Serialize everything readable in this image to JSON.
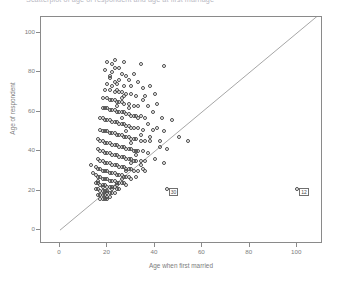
{
  "chart_title": "Scatterplot of age of respondent and age at first marriage",
  "axes": {
    "y_title": "Age of respondent",
    "x_title": "Age when first married",
    "y_ticks": [
      0,
      20,
      40,
      60,
      80,
      100
    ],
    "x_ticks": [
      0,
      20,
      40,
      60,
      80,
      100
    ],
    "y_min": -6,
    "y_max": 108,
    "x_min": -8,
    "x_max": 110
  },
  "reference_line": {
    "label": "identity-line",
    "from": [
      0,
      0
    ],
    "to": [
      110,
      110
    ]
  },
  "annotations": [
    {
      "label": "30",
      "x": 45,
      "y": 21
    },
    {
      "label": "12",
      "x": 100,
      "y": 21
    }
  ],
  "colors": {
    "frame": "#8a8a8a",
    "marker": "#4a4a4a",
    "line": "#8f8f8f",
    "text": "#7c7c7c",
    "title": "#b9b9c4"
  },
  "chart_data": {
    "type": "scatter",
    "title": "Scatterplot of age of respondent and age at first marriage",
    "xlabel": "Age when first married",
    "ylabel": "Age of respondent",
    "xlim": [
      -8,
      110
    ],
    "ylim": [
      -6,
      108
    ],
    "grid": false,
    "legend": "none",
    "marker_style": "open-circle",
    "series": [
      {
        "name": "respondents",
        "points": [
          [
            23,
            86
          ],
          [
            22,
            84
          ],
          [
            27,
            85
          ],
          [
            23,
            82
          ],
          [
            34,
            84
          ],
          [
            44,
            83
          ],
          [
            22,
            80
          ],
          [
            26,
            79
          ],
          [
            28,
            78
          ],
          [
            31,
            79
          ],
          [
            21,
            77
          ],
          [
            25,
            76
          ],
          [
            29,
            76
          ],
          [
            33,
            75
          ],
          [
            20,
            74
          ],
          [
            24,
            74
          ],
          [
            27,
            73
          ],
          [
            30,
            73
          ],
          [
            35,
            72
          ],
          [
            38,
            73
          ],
          [
            19,
            71
          ],
          [
            21,
            71
          ],
          [
            23,
            70
          ],
          [
            25,
            70
          ],
          [
            26,
            70
          ],
          [
            28,
            69
          ],
          [
            30,
            69
          ],
          [
            32,
            68
          ],
          [
            36,
            68
          ],
          [
            40,
            69
          ],
          [
            18,
            67
          ],
          [
            20,
            67
          ],
          [
            21,
            66
          ],
          [
            22,
            66
          ],
          [
            23,
            66
          ],
          [
            24,
            65
          ],
          [
            25,
            65
          ],
          [
            26,
            65
          ],
          [
            27,
            64
          ],
          [
            29,
            64
          ],
          [
            31,
            63
          ],
          [
            33,
            63
          ],
          [
            37,
            63
          ],
          [
            41,
            64
          ],
          [
            18,
            62
          ],
          [
            19,
            62
          ],
          [
            20,
            62
          ],
          [
            21,
            61
          ],
          [
            22,
            61
          ],
          [
            23,
            61
          ],
          [
            24,
            60
          ],
          [
            25,
            60
          ],
          [
            26,
            60
          ],
          [
            27,
            60
          ],
          [
            28,
            59
          ],
          [
            29,
            59
          ],
          [
            30,
            58
          ],
          [
            32,
            58
          ],
          [
            34,
            58
          ],
          [
            36,
            57
          ],
          [
            17,
            57
          ],
          [
            18,
            57
          ],
          [
            19,
            56
          ],
          [
            20,
            56
          ],
          [
            21,
            56
          ],
          [
            22,
            55
          ],
          [
            23,
            55
          ],
          [
            24,
            55
          ],
          [
            25,
            54
          ],
          [
            26,
            54
          ],
          [
            27,
            54
          ],
          [
            28,
            53
          ],
          [
            29,
            53
          ],
          [
            30,
            52
          ],
          [
            31,
            52
          ],
          [
            33,
            52
          ],
          [
            35,
            51
          ],
          [
            39,
            51
          ],
          [
            44,
            50
          ],
          [
            17,
            51
          ],
          [
            18,
            50
          ],
          [
            19,
            50
          ],
          [
            20,
            50
          ],
          [
            21,
            49
          ],
          [
            22,
            49
          ],
          [
            23,
            49
          ],
          [
            24,
            48
          ],
          [
            25,
            48
          ],
          [
            26,
            48
          ],
          [
            27,
            47
          ],
          [
            28,
            47
          ],
          [
            29,
            47
          ],
          [
            30,
            46
          ],
          [
            31,
            46
          ],
          [
            32,
            46
          ],
          [
            34,
            45
          ],
          [
            36,
            45
          ],
          [
            38,
            45
          ],
          [
            42,
            45
          ],
          [
            16,
            46
          ],
          [
            17,
            45
          ],
          [
            18,
            45
          ],
          [
            19,
            44
          ],
          [
            20,
            44
          ],
          [
            21,
            44
          ],
          [
            22,
            43
          ],
          [
            23,
            43
          ],
          [
            24,
            43
          ],
          [
            25,
            42
          ],
          [
            26,
            42
          ],
          [
            27,
            42
          ],
          [
            28,
            41
          ],
          [
            29,
            41
          ],
          [
            30,
            41
          ],
          [
            31,
            40
          ],
          [
            32,
            40
          ],
          [
            33,
            40
          ],
          [
            35,
            40
          ],
          [
            37,
            39
          ],
          [
            16,
            41
          ],
          [
            17,
            40
          ],
          [
            18,
            40
          ],
          [
            19,
            39
          ],
          [
            20,
            39
          ],
          [
            21,
            39
          ],
          [
            22,
            38
          ],
          [
            23,
            38
          ],
          [
            24,
            38
          ],
          [
            25,
            37
          ],
          [
            26,
            37
          ],
          [
            27,
            37
          ],
          [
            28,
            36
          ],
          [
            29,
            36
          ],
          [
            30,
            36
          ],
          [
            31,
            35
          ],
          [
            32,
            35
          ],
          [
            34,
            35
          ],
          [
            36,
            35
          ],
          [
            16,
            36
          ],
          [
            17,
            35
          ],
          [
            18,
            35
          ],
          [
            19,
            34
          ],
          [
            20,
            34
          ],
          [
            21,
            34
          ],
          [
            22,
            33
          ],
          [
            23,
            33
          ],
          [
            24,
            33
          ],
          [
            25,
            32
          ],
          [
            26,
            32
          ],
          [
            27,
            32
          ],
          [
            28,
            31
          ],
          [
            29,
            31
          ],
          [
            30,
            31
          ],
          [
            31,
            30
          ],
          [
            33,
            30
          ],
          [
            35,
            31
          ],
          [
            15,
            32
          ],
          [
            16,
            31
          ],
          [
            17,
            31
          ],
          [
            18,
            30
          ],
          [
            19,
            30
          ],
          [
            20,
            30
          ],
          [
            21,
            29
          ],
          [
            22,
            29
          ],
          [
            23,
            29
          ],
          [
            24,
            28
          ],
          [
            25,
            28
          ],
          [
            26,
            28
          ],
          [
            27,
            27
          ],
          [
            28,
            27
          ],
          [
            29,
            27
          ],
          [
            30,
            26
          ],
          [
            32,
            27
          ],
          [
            15,
            28
          ],
          [
            16,
            27
          ],
          [
            17,
            27
          ],
          [
            18,
            26
          ],
          [
            19,
            26
          ],
          [
            20,
            26
          ],
          [
            21,
            25
          ],
          [
            22,
            25
          ],
          [
            23,
            25
          ],
          [
            24,
            24
          ],
          [
            25,
            24
          ],
          [
            26,
            24
          ],
          [
            27,
            24
          ],
          [
            28,
            23
          ],
          [
            15,
            24
          ],
          [
            16,
            24
          ],
          [
            17,
            23
          ],
          [
            18,
            23
          ],
          [
            19,
            23
          ],
          [
            20,
            22
          ],
          [
            21,
            22
          ],
          [
            22,
            22
          ],
          [
            23,
            22
          ],
          [
            24,
            21
          ],
          [
            25,
            21
          ],
          [
            15,
            21
          ],
          [
            16,
            21
          ],
          [
            17,
            20
          ],
          [
            18,
            20
          ],
          [
            19,
            20
          ],
          [
            20,
            20
          ],
          [
            21,
            19
          ],
          [
            22,
            19
          ],
          [
            23,
            19
          ],
          [
            16,
            18
          ],
          [
            17,
            18
          ],
          [
            18,
            18
          ],
          [
            19,
            18
          ],
          [
            20,
            17
          ],
          [
            21,
            17
          ],
          [
            17,
            16
          ],
          [
            18,
            16
          ],
          [
            19,
            16
          ],
          [
            20,
            16
          ],
          [
            26,
            67
          ],
          [
            24,
            71
          ],
          [
            22,
            73
          ],
          [
            25,
            82
          ],
          [
            20,
            85
          ],
          [
            35,
            66
          ],
          [
            39,
            60
          ],
          [
            43,
            57
          ],
          [
            47,
            56
          ],
          [
            50,
            47
          ],
          [
            54,
            45
          ],
          [
            33,
            57
          ],
          [
            37,
            54
          ],
          [
            41,
            52
          ],
          [
            34,
            48
          ],
          [
            38,
            47
          ],
          [
            42,
            42
          ],
          [
            45,
            41
          ],
          [
            31,
            58
          ],
          [
            29,
            62
          ],
          [
            27,
            68
          ],
          [
            23,
            75
          ],
          [
            21,
            78
          ],
          [
            19,
            81
          ],
          [
            24,
            63
          ],
          [
            26,
            57
          ],
          [
            28,
            50
          ],
          [
            30,
            44
          ],
          [
            32,
            38
          ],
          [
            34,
            33
          ],
          [
            36,
            30
          ],
          [
            40,
            36
          ],
          [
            44,
            34
          ],
          [
            30,
            34
          ],
          [
            28,
            30
          ],
          [
            26,
            26
          ],
          [
            24,
            23
          ],
          [
            22,
            21
          ],
          [
            20,
            19
          ],
          [
            18,
            22
          ],
          [
            16,
            25
          ],
          [
            14,
            29
          ],
          [
            13,
            33
          ],
          [
            45,
            21
          ],
          [
            100,
            21
          ]
        ]
      }
    ]
  }
}
